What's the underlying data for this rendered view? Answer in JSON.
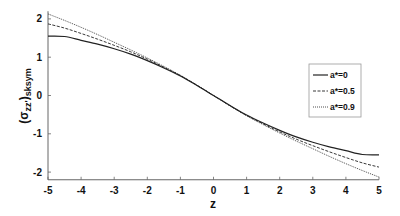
{
  "chart_data": {
    "type": "line",
    "title": "",
    "xlabel": "z",
    "ylabel": "(σ_zz')_sksym",
    "ylabel_main": "(σ",
    "ylabel_sub": "zz'",
    "ylabel_close": ")",
    "ylabel_sub2": "sksym",
    "xlim": [
      -5,
      5
    ],
    "ylim": [
      -2.2,
      2.2
    ],
    "xticks": [
      -5,
      -4,
      -3,
      -2,
      -1,
      0,
      1,
      2,
      3,
      4,
      5
    ],
    "yticks": [
      -2,
      -1,
      0,
      1,
      2
    ],
    "grid": false,
    "legend_position": "right-middle",
    "x": [
      -5,
      -4.5,
      -4,
      -3.5,
      -3,
      -2.5,
      -2,
      -1.5,
      -1,
      -0.5,
      0,
      0.5,
      1,
      1.5,
      2,
      2.5,
      3,
      3.5,
      4,
      4.5,
      5
    ],
    "series": [
      {
        "name": "a*=0",
        "style": "solid",
        "values": [
          1.55,
          1.54,
          1.44,
          1.34,
          1.22,
          1.08,
          0.91,
          0.72,
          0.51,
          0.26,
          0.0,
          -0.26,
          -0.51,
          -0.72,
          -0.91,
          -1.08,
          -1.22,
          -1.34,
          -1.44,
          -1.54,
          -1.55
        ]
      },
      {
        "name": "a*=0.5",
        "style": "dashed",
        "values": [
          1.87,
          1.76,
          1.62,
          1.47,
          1.31,
          1.14,
          0.95,
          0.74,
          0.52,
          0.27,
          0.0,
          -0.27,
          -0.52,
          -0.74,
          -0.95,
          -1.14,
          -1.31,
          -1.47,
          -1.62,
          -1.76,
          -1.87
        ]
      },
      {
        "name": "a*=0.9",
        "style": "dotted",
        "values": [
          2.13,
          1.96,
          1.78,
          1.59,
          1.39,
          1.19,
          0.98,
          0.76,
          0.53,
          0.27,
          0.0,
          -0.27,
          -0.53,
          -0.76,
          -0.98,
          -1.19,
          -1.39,
          -1.59,
          -1.78,
          -1.96,
          -2.13
        ]
      }
    ]
  },
  "colors": {
    "line": "#222222",
    "axis": "#666666",
    "background": "#ffffff"
  }
}
